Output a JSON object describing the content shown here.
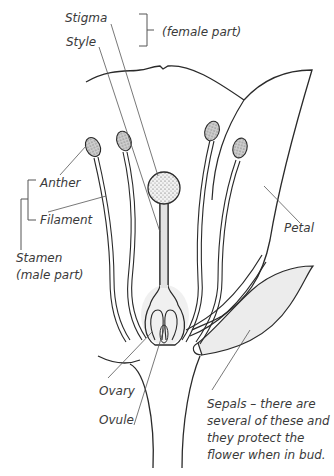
{
  "diagram": {
    "labels": {
      "stigma": "Stigma",
      "style": "Style",
      "female_part": "(female part)",
      "anther": "Anther",
      "filament": "Filament",
      "stamen": "Stamen",
      "male_part": "(male part)",
      "petal": "Petal",
      "ovary": "Ovary",
      "ovule": "Ovule",
      "sepals_line1": "Sepals – there are",
      "sepals_line2": "several of these and",
      "sepals_line3": "they protect the",
      "sepals_line4": "flower when in bud."
    },
    "colors": {
      "line": "#2a2a2a",
      "leader": "#555555",
      "fill_shade": "#e4e4e4",
      "anther_fill": "#bdbdbd"
    }
  }
}
